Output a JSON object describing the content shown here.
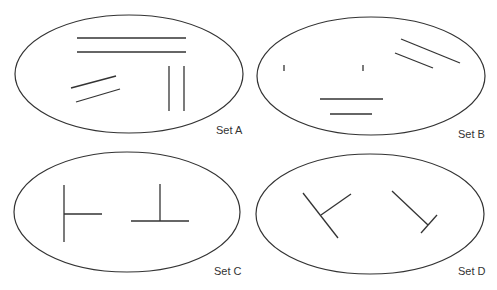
{
  "diagram": {
    "sets": [
      {
        "label": "Set A",
        "ellipse": {
          "cx": 129,
          "cy": 74,
          "rx": 114,
          "ry": 59
        },
        "label_pos": {
          "x": 216,
          "y": 134
        },
        "lines": [
          [
            77,
            38,
            186,
            38
          ],
          [
            77,
            52,
            186,
            52
          ],
          [
            169,
            66,
            169,
            111
          ],
          [
            184,
            66,
            184,
            111
          ],
          [
            71,
            88,
            116,
            76
          ],
          [
            76,
            102,
            120,
            89
          ]
        ]
      },
      {
        "label": "Set B",
        "ellipse": {
          "cx": 371,
          "cy": 76,
          "rx": 114,
          "ry": 59
        },
        "label_pos": {
          "x": 458,
          "y": 138
        },
        "lines": [
          [
            284,
            65,
            284,
            71
          ],
          [
            363,
            65,
            363,
            71
          ],
          [
            401,
            39,
            460,
            63
          ],
          [
            395,
            53,
            433,
            68
          ],
          [
            320,
            99,
            383,
            99
          ],
          [
            330,
            114,
            372,
            114
          ]
        ]
      },
      {
        "label": "Set C",
        "ellipse": {
          "cx": 127,
          "cy": 212,
          "rx": 113,
          "ry": 60
        },
        "label_pos": {
          "x": 214,
          "y": 275
        },
        "lines": [
          [
            64,
            185,
            64,
            242
          ],
          [
            64,
            214,
            102,
            214
          ],
          [
            160,
            184,
            160,
            221
          ],
          [
            131,
            221,
            189,
            221
          ]
        ]
      },
      {
        "label": "Set D",
        "ellipse": {
          "cx": 370,
          "cy": 214,
          "rx": 114,
          "ry": 60
        },
        "label_pos": {
          "x": 458,
          "y": 275
        },
        "lines": [
          [
            303,
            193,
            338,
            238
          ],
          [
            321,
            215,
            351,
            194
          ],
          [
            392,
            191,
            428,
            225
          ],
          [
            421,
            233,
            437,
            215
          ]
        ]
      }
    ],
    "colors": {
      "stroke": "#333333",
      "background": "#ffffff"
    }
  }
}
